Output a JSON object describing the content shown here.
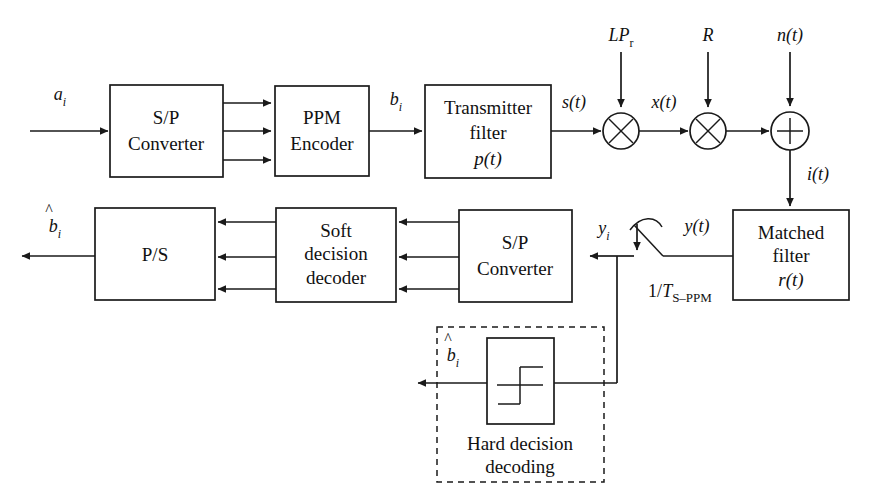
{
  "figure": {
    "type": "signal-flow-block-diagram"
  },
  "blocks": {
    "sp_converter_tx": {
      "line1": "S/P",
      "line2": "Converter"
    },
    "ppm_encoder": {
      "line1": "PPM",
      "line2": "Encoder"
    },
    "transmitter_filter": {
      "line1": "Transmitter",
      "line2": "filter",
      "line3": "p(t)"
    },
    "matched_filter": {
      "line1": "Matched",
      "line2": "filter",
      "line3": "r(t)"
    },
    "sp_converter_rx": {
      "line1": "S/P",
      "line2": "Converter"
    },
    "soft_decision_decoder": {
      "line1": "Soft",
      "line2": "decision",
      "line3": "decoder"
    },
    "ps_converter": {
      "line1": "P/S"
    },
    "hard_decision": {
      "line1": "Hard decision",
      "line2": "decoding"
    }
  },
  "signals": {
    "a_i": "a",
    "a_i_sub": "i",
    "b_i": "b",
    "b_i_sub": "i",
    "s_t": "s(t)",
    "x_t": "x(t)",
    "i_t": "i(t)",
    "n_t": "n(t)",
    "y_t": "y(t)",
    "y_i": "y",
    "y_i_sub": "i",
    "b_hat_out": "b",
    "b_hat_out_sub": "i",
    "b_hat_hard": "b",
    "b_hat_hard_sub": "i",
    "lp_main": "LP",
    "lp_sub": "r",
    "r_gain": "R",
    "sample_rate_num": "1/",
    "sample_rate_T": "T",
    "sample_rate_sub": "S–PPM"
  },
  "operators": {
    "multiplier_1": "×",
    "multiplier_2": "×",
    "adder": "+"
  },
  "colors": {
    "line": "#1a1a1a",
    "text": "#111111",
    "background": "#ffffff"
  }
}
